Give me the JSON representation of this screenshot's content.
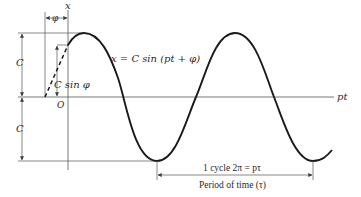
{
  "figure": {
    "type": "sinusoid-phase-diagram",
    "equation_label": "x = C sin (pt + φ)",
    "x_axis_label": "x",
    "horizontal_axis_label": "pt",
    "origin_label": "O",
    "amplitude_label_top": "C",
    "amplitude_label_bottom": "C",
    "phase_label": "φ",
    "initial_displacement_label": "C sin φ",
    "cycle_label": "1 cycle  2π = pτ",
    "period_label": "Period of time (τ)",
    "colors": {
      "curve": "#1a1a1a",
      "lines": "#6a6a6a",
      "text": "#2a2a2a",
      "background": "#ffffff"
    }
  }
}
